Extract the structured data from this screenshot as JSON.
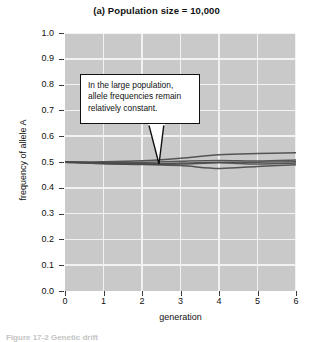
{
  "figure": {
    "title": "(a) Population size = 10,000",
    "caption": "Figure 17-2  Genetic drift"
  },
  "annotation": {
    "line1": "In the large population,",
    "line2": "allele frequencies remain",
    "line3": "relatively constant."
  },
  "axes": {
    "x_title": "generation",
    "y_title": "frequency of allele A",
    "x_ticks": [
      "0",
      "1",
      "2",
      "3",
      "4",
      "5",
      "6"
    ],
    "y_ticks": [
      "1.0",
      "0.9",
      "0.8",
      "0.7",
      "0.6",
      "0.5",
      "0.4",
      "0.3",
      "0.2",
      "0.1",
      "0.0"
    ]
  },
  "colors": {
    "plot_background": "#c9c9c9",
    "gridline": "#f2f2f2",
    "line_color": "#4a4a4a",
    "axis_color": "#3a3a3a",
    "callout_background": "#ffffff",
    "callout_border": "#111111"
  },
  "chart_data": {
    "type": "line",
    "title": "(a) Population size = 10,000",
    "xlabel": "generation",
    "ylabel": "frequency of allele A",
    "xlim": [
      0,
      6
    ],
    "ylim": [
      0.0,
      1.0
    ],
    "grid": true,
    "legend": "none",
    "x": [
      0,
      1,
      2,
      3,
      4,
      5,
      6
    ],
    "series": [
      {
        "name": "replicate 1",
        "values": [
          0.5,
          0.501,
          0.505,
          0.515,
          0.528,
          0.533,
          0.536
        ]
      },
      {
        "name": "replicate 2",
        "values": [
          0.5,
          0.498,
          0.499,
          0.503,
          0.506,
          0.504,
          0.508
        ]
      },
      {
        "name": "replicate 3",
        "values": [
          0.5,
          0.496,
          0.494,
          0.496,
          0.499,
          0.499,
          0.501
        ]
      },
      {
        "name": "replicate 4",
        "values": [
          0.499,
          0.494,
          0.492,
          0.492,
          0.497,
          0.492,
          0.496
        ]
      },
      {
        "name": "replicate 5",
        "values": [
          0.499,
          0.493,
          0.49,
          0.486,
          0.475,
          0.483,
          0.489
        ]
      }
    ]
  }
}
